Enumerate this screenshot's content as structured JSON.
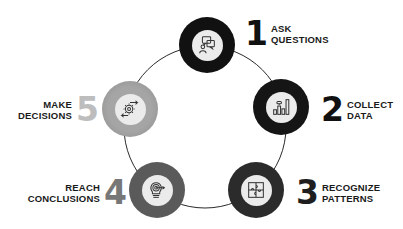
{
  "diagram": {
    "type": "cycle",
    "colors": {
      "ring_line": "#2a2a2a",
      "inner_fill": "#ebebeb",
      "icon_stroke": "#333333"
    },
    "steps": [
      {
        "number": "1",
        "line1": "ASK",
        "line2": "QUESTIONS",
        "icon": "chat-bubbles-person-icon",
        "ring_color": "#111111",
        "number_color": "#111111"
      },
      {
        "number": "2",
        "line1": "COLLECT",
        "line2": "DATA",
        "icon": "bar-chart-icon",
        "ring_color": "#151515",
        "number_color": "#111111"
      },
      {
        "number": "3",
        "line1": "RECOGNIZE",
        "line2": "PATTERNS",
        "icon": "puzzle-icon",
        "ring_color": "#2b2b2b",
        "number_color": "#1e1e1e"
      },
      {
        "number": "4",
        "line1": "REACH",
        "line2": "CONCLUSIONS",
        "icon": "lightbulb-target-icon",
        "ring_color": "#5a5a5a",
        "number_color": "#777777"
      },
      {
        "number": "5",
        "line1": "MAKE",
        "line2": "DECISIONS",
        "icon": "gear-arrows-icon",
        "ring_color": "#9a9a9a",
        "number_color": "#bdbdbd"
      }
    ]
  }
}
